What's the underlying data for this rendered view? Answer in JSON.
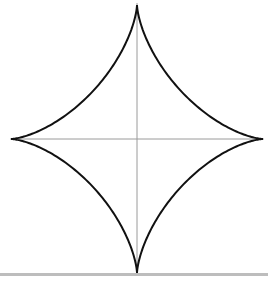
{
  "figure": {
    "curve": {
      "name": "astroid",
      "equation": "x^(2/3) + y^(2/3) = a^(2/3)",
      "parameter_range": [
        0,
        6.283185307
      ],
      "samples": 400,
      "stroke_color": "#111111"
    },
    "axes": {
      "color": "#9a9a9a",
      "show_x_axis": true,
      "show_y_axis": true
    }
  },
  "divider": {
    "color": "#bdbdbd"
  }
}
